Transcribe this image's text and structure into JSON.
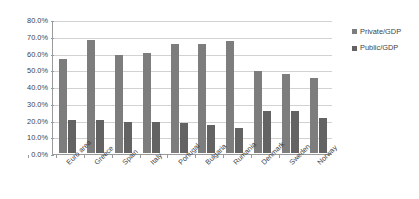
{
  "chart_data": {
    "type": "bar",
    "title": "",
    "subtitle": "",
    "xlabel": "",
    "ylabel": "",
    "ylim": [
      0,
      80
    ],
    "ytick_labels": [
      "80.0%",
      "70.0%",
      "60.0%",
      "50.0%",
      "40.0%",
      "30.0%",
      "20.0%",
      "10.0%",
      "0.0%"
    ],
    "ytick_values": [
      80,
      70,
      60,
      50,
      40,
      30,
      20,
      10,
      0
    ],
    "grid": true,
    "legend_position": "right",
    "categories": [
      "Euro area",
      "Greece",
      "Spain",
      "Italy",
      "Portugal",
      "Bulgaria",
      "Rumania",
      "Denmark",
      "Sweden",
      "Norway"
    ],
    "series": [
      {
        "name": "Private/GDP",
        "color": "#7d7d7d",
        "values": [
          56.0,
          67.5,
          58.5,
          60.0,
          65.0,
          65.0,
          67.0,
          49.0,
          47.0,
          45.0
        ]
      },
      {
        "name": "Public/GDP",
        "color": "#636363",
        "values": [
          19.5,
          19.5,
          18.5,
          18.5,
          18.0,
          16.5,
          15.0,
          25.0,
          25.0,
          21.0
        ]
      }
    ]
  },
  "legend": {
    "items": [
      {
        "label": "Private/GDP"
      },
      {
        "label": "Public/GDP"
      }
    ]
  },
  "colors": {
    "private": "#7d7d7d",
    "public": "#636363",
    "gridline": "#d2d2d2",
    "axis": "#9a9a9a",
    "text": "#3f3f3f",
    "background": "#ffffff"
  }
}
